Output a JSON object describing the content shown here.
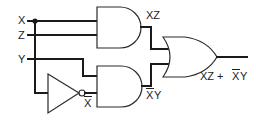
{
  "diagram": {
    "type": "logic-circuit",
    "inputs": [
      {
        "label": "X"
      },
      {
        "label": "Z"
      },
      {
        "label": "Y"
      }
    ],
    "gates": [
      {
        "id": "and1",
        "type": "AND",
        "inputs": [
          "X",
          "Z"
        ],
        "output_label": "XZ"
      },
      {
        "id": "not1",
        "type": "NOT",
        "inputs": [
          "X"
        ],
        "output_label": "X",
        "output_overline": true
      },
      {
        "id": "and2",
        "type": "AND",
        "inputs": [
          "Y",
          "X̄"
        ],
        "output_label_main": "X",
        "output_label_suffix": "Y",
        "output_overline_first": true
      },
      {
        "id": "or1",
        "type": "OR",
        "inputs": [
          "XZ",
          "X̄Y"
        ],
        "output_label_a": "XZ + ",
        "output_label_b": "X",
        "output_label_c": "Y"
      }
    ],
    "colors": {
      "line": "#1a1a1a",
      "background": "#ffffff"
    }
  }
}
